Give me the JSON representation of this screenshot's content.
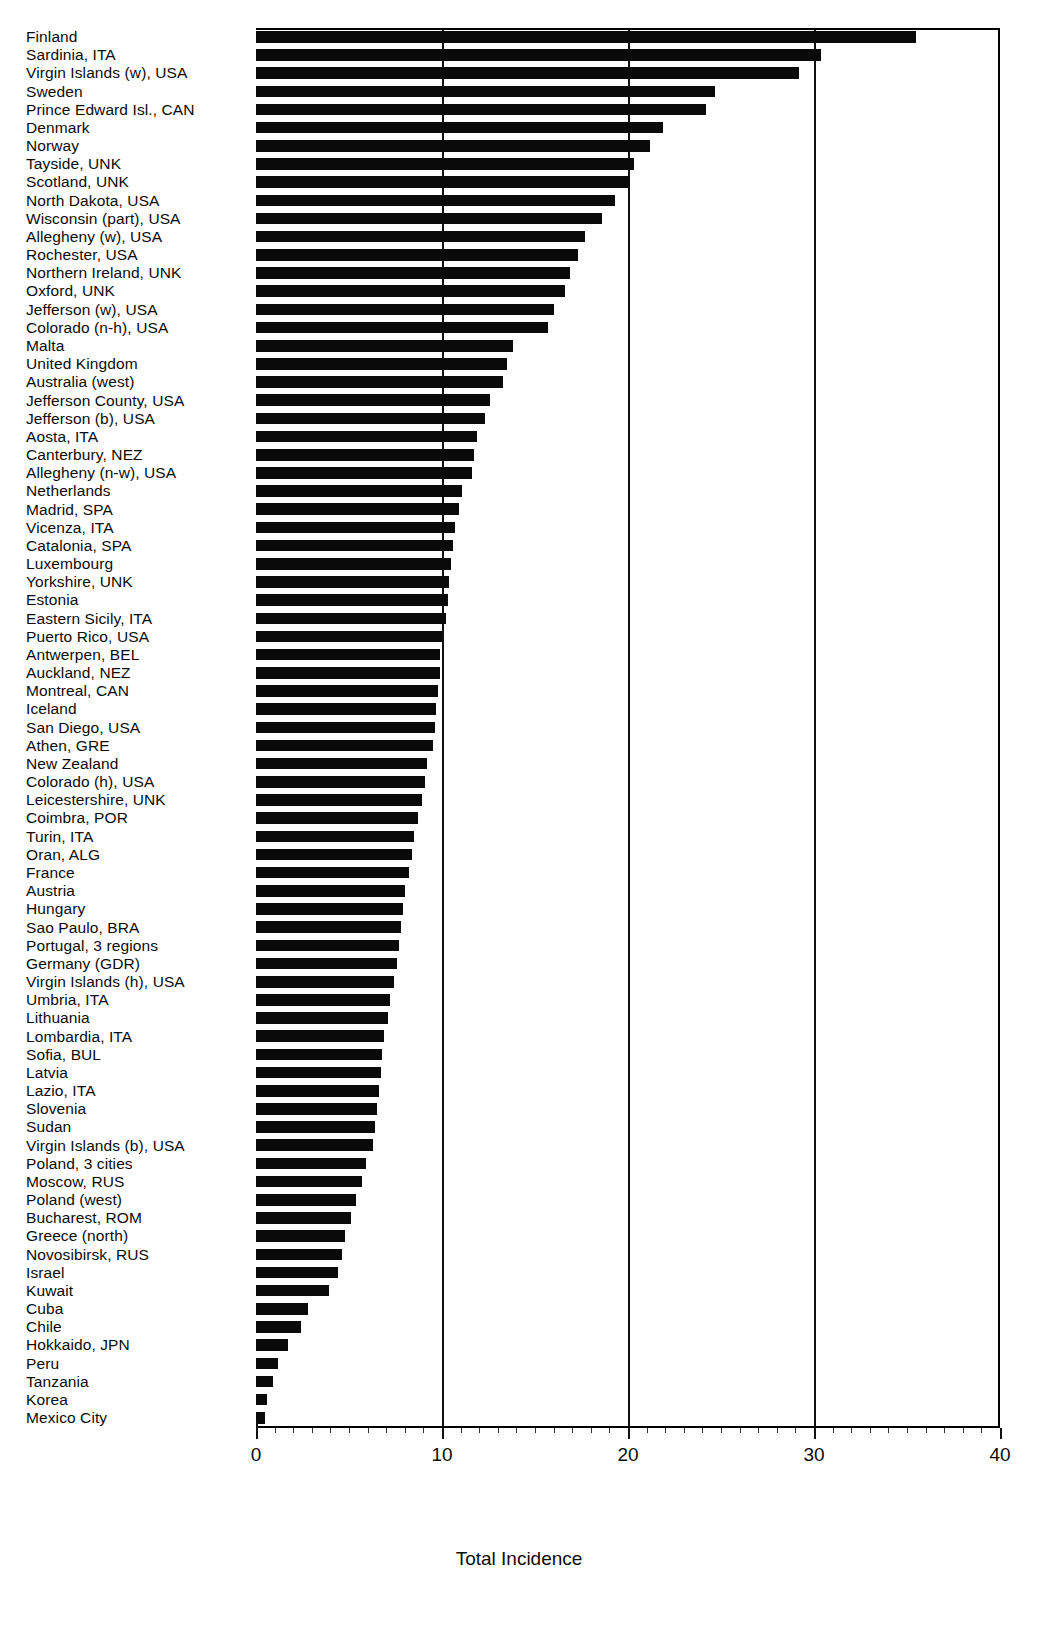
{
  "chart_data": {
    "type": "bar",
    "orientation": "horizontal",
    "title": "",
    "xlabel": "Total Incidence",
    "ylabel": "",
    "xlim": [
      0,
      40
    ],
    "xticks": [
      0,
      10,
      20,
      30,
      40
    ],
    "xticklabels": [
      "0",
      "10",
      "20",
      "30",
      "40"
    ],
    "grid": true,
    "grid_axis": "x",
    "bar_color": "#0a0a0a",
    "categories": [
      "Finland",
      "Sardinia, ITA",
      "Virgin Islands (w), USA",
      "Sweden",
      "Prince Edward Isl., CAN",
      "Denmark",
      "Norway",
      "Tayside, UNK",
      "Scotland, UNK",
      "North Dakota, USA",
      "Wisconsin (part), USA",
      "Allegheny (w), USA",
      "Rochester, USA",
      "Northern Ireland, UNK",
      "Oxford, UNK",
      "Jefferson (w), USA",
      "Colorado (n-h), USA",
      "Malta",
      "United Kingdom",
      "Australia (west)",
      "Jefferson County, USA",
      "Jefferson (b), USA",
      "Aosta, ITA",
      "Canterbury, NEZ",
      "Allegheny (n-w), USA",
      "Netherlands",
      "Madrid, SPA",
      "Vicenza, ITA",
      "Catalonia, SPA",
      "Luxembourg",
      "Yorkshire, UNK",
      "Estonia",
      "Eastern Sicily, ITA",
      "Puerto Rico, USA",
      "Antwerpen, BEL",
      "Auckland, NEZ",
      "Montreal, CAN",
      "Iceland",
      "San Diego, USA",
      "Athen, GRE",
      "New Zealand",
      "Colorado (h), USA",
      "Leicestershire, UNK",
      "Coimbra, POR",
      "Turin, ITA",
      "Oran, ALG",
      "France",
      "Austria",
      "Hungary",
      "Sao Paulo, BRA",
      "Portugal, 3 regions",
      "Germany (GDR)",
      "Virgin Islands (h), USA",
      "Umbria, ITA",
      "Lithuania",
      "Lombardia, ITA",
      "Sofia, BUL",
      "Latvia",
      "Lazio, ITA",
      "Slovenia",
      "Sudan",
      "Virgin Islands (b), USA",
      "Poland, 3 cities",
      "Moscow, RUS",
      "Poland (west)",
      "Bucharest, ROM",
      "Greece (north)",
      "Novosibirsk, RUS",
      "Israel",
      "Kuwait",
      "Cuba",
      "Chile",
      "Hokkaido, JPN",
      "Peru",
      "Tanzania",
      "Korea",
      "Mexico City"
    ],
    "values": [
      35.5,
      30.4,
      29.2,
      24.7,
      24.2,
      21.9,
      21.2,
      20.3,
      20.1,
      19.3,
      18.6,
      17.7,
      17.3,
      16.9,
      16.6,
      16.0,
      15.7,
      13.8,
      13.5,
      13.3,
      12.6,
      12.3,
      11.9,
      11.7,
      11.6,
      11.1,
      10.9,
      10.7,
      10.6,
      10.5,
      10.4,
      10.3,
      10.2,
      10.0,
      9.9,
      9.9,
      9.8,
      9.7,
      9.6,
      9.5,
      9.2,
      9.1,
      8.9,
      8.7,
      8.5,
      8.4,
      8.2,
      8.0,
      7.9,
      7.8,
      7.7,
      7.6,
      7.4,
      7.2,
      7.1,
      6.9,
      6.8,
      6.7,
      6.6,
      6.5,
      6.4,
      6.3,
      5.9,
      5.7,
      5.4,
      5.1,
      4.8,
      4.6,
      4.4,
      3.9,
      2.8,
      2.4,
      1.7,
      1.2,
      0.9,
      0.6,
      0.5
    ]
  },
  "axis": {
    "xlabel": "Total Incidence"
  }
}
